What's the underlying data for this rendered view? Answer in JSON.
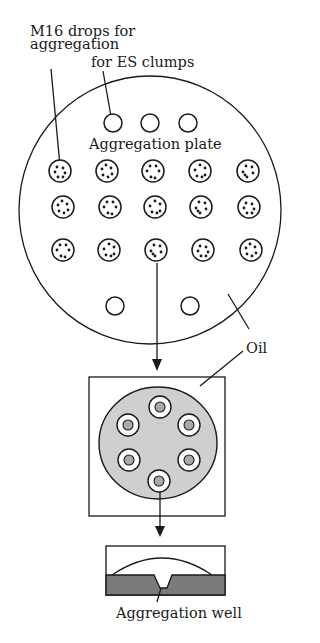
{
  "labels": {
    "m16_line1": "M16 drops for",
    "m16_line2": "aggregation",
    "es_clumps": "for ES clumps",
    "aggregation_plate": "Aggregation plate",
    "oil": "Oil",
    "aggregation_well": "Aggregation well"
  },
  "plate": {
    "empty_drops_top": 3,
    "drop_rows": 3,
    "drop_columns": 5,
    "empty_drops_bottom": 2
  },
  "dish": {
    "ring_wells": 6
  },
  "colors": {
    "line": "#1a1a1a",
    "dish_fill": "#cfcfcf",
    "well_fill": "#a9a9a9",
    "well_band": "#7a7a7a",
    "background": "#ffffff"
  }
}
